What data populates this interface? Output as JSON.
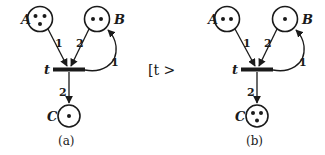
{
  "figure": {
    "firing_notation": "[t >",
    "panels": [
      {
        "caption": "(a)",
        "transition_label": "t",
        "places": [
          {
            "name": "A",
            "tokens": 3
          },
          {
            "name": "B",
            "tokens": 2
          },
          {
            "name": "C",
            "tokens": 1
          }
        ],
        "arcs": [
          {
            "from": "A",
            "to": "t",
            "weight": "1"
          },
          {
            "from": "B",
            "to": "t",
            "weight": "2"
          },
          {
            "from": "t",
            "to": "B",
            "weight": "1"
          },
          {
            "from": "t",
            "to": "C",
            "weight": "2"
          }
        ]
      },
      {
        "caption": "(b)",
        "transition_label": "t",
        "places": [
          {
            "name": "A",
            "tokens": 2
          },
          {
            "name": "B",
            "tokens": 1
          },
          {
            "name": "C",
            "tokens": 3
          }
        ],
        "arcs": [
          {
            "from": "A",
            "to": "t",
            "weight": "1"
          },
          {
            "from": "B",
            "to": "t",
            "weight": "2"
          },
          {
            "from": "t",
            "to": "B",
            "weight": "1"
          },
          {
            "from": "t",
            "to": "C",
            "weight": "2"
          }
        ]
      }
    ]
  }
}
